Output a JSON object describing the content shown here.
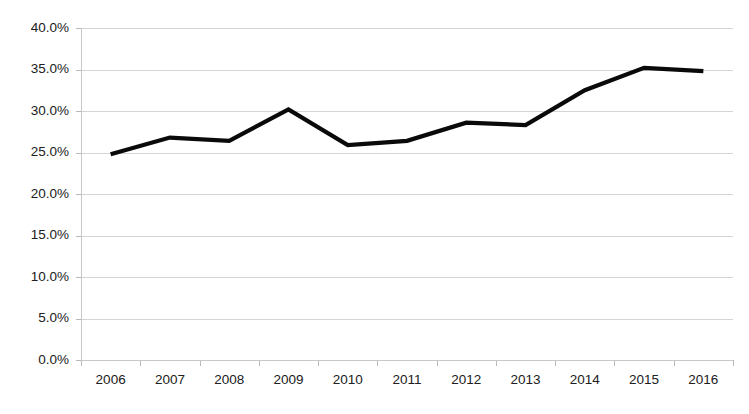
{
  "chart_data": {
    "type": "line",
    "title": "",
    "subtitle": "",
    "xlabel": "",
    "ylabel": "",
    "categories": [
      "2006",
      "2007",
      "2008",
      "2009",
      "2010",
      "2011",
      "2012",
      "2013",
      "2014",
      "2015",
      "2016"
    ],
    "values": [
      24.8,
      26.8,
      26.4,
      30.2,
      25.9,
      26.4,
      28.6,
      28.3,
      32.5,
      35.2,
      34.8
    ],
    "series": [
      {
        "name": "",
        "color": "#0a0a0a",
        "values": [
          24.8,
          26.8,
          26.4,
          30.2,
          25.9,
          26.4,
          28.6,
          28.3,
          32.5,
          35.2,
          34.8
        ]
      }
    ],
    "ylim": [
      0,
      40
    ],
    "ytick_values": [
      0,
      5,
      10,
      15,
      20,
      25,
      30,
      35,
      40
    ],
    "ytick_labels": [
      "0.0%",
      "5.0%",
      "10.0%",
      "15.0%",
      "20.0%",
      "25.0%",
      "30.0%",
      "35.0%",
      "40.0%"
    ],
    "xtick_labels": [
      "2006",
      "2007",
      "2008",
      "2009",
      "2010",
      "2011",
      "2012",
      "2013",
      "2014",
      "2015",
      "2016"
    ],
    "value_suffix": "%",
    "grid": true,
    "grid_axis": "y",
    "legend": false,
    "legend_position": "none",
    "markers": false,
    "annotations": []
  },
  "style": {
    "background_color": "#ffffff",
    "gridline_color": "#d4d4d4",
    "axis_color": "#c8c8c8",
    "tick_color": "#b8b8b8",
    "label_color": "#202020",
    "series_color": "#0a0a0a"
  },
  "layout": {
    "plot_left": 81,
    "plot_right": 733,
    "plot_top": 28,
    "plot_bottom": 360
  }
}
